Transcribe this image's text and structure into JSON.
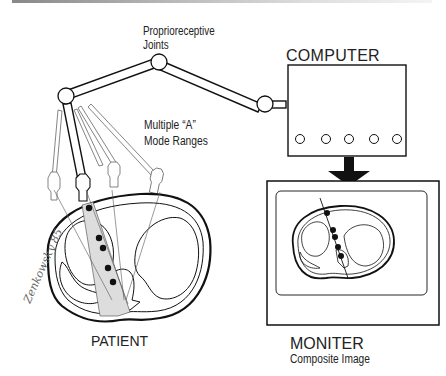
{
  "diagram": {
    "labels": {
      "joints_line1": "Proprioreceptive",
      "joints_line2": "Joints",
      "modes_line1": "Multiple “A”",
      "modes_line2": "Mode Ranges",
      "computer": "COMPUTER",
      "patient": "PATIENT",
      "monitor": "MONITER",
      "monitor_sub": "Composite Image"
    },
    "components": [
      {
        "id": "articulated-arm",
        "type": "arm",
        "joints": 3
      },
      {
        "id": "ultrasound-transducers",
        "type": "probe",
        "count": 5
      },
      {
        "id": "computer",
        "type": "box",
        "indicator_lights": 5
      },
      {
        "id": "arrow-computer-to-monitor",
        "type": "arrow",
        "direction": "down"
      },
      {
        "id": "monitor",
        "type": "screen"
      },
      {
        "id": "patient-cross-section",
        "type": "anatomy",
        "echo_points": 5
      },
      {
        "id": "composite-image",
        "type": "anatomy",
        "echo_points": 5
      }
    ],
    "signature": "Zenkowsky 85",
    "colors": {
      "line": "#111111",
      "thin_line": "#555555",
      "shade": "#dddddd",
      "background": "#ffffff"
    }
  }
}
